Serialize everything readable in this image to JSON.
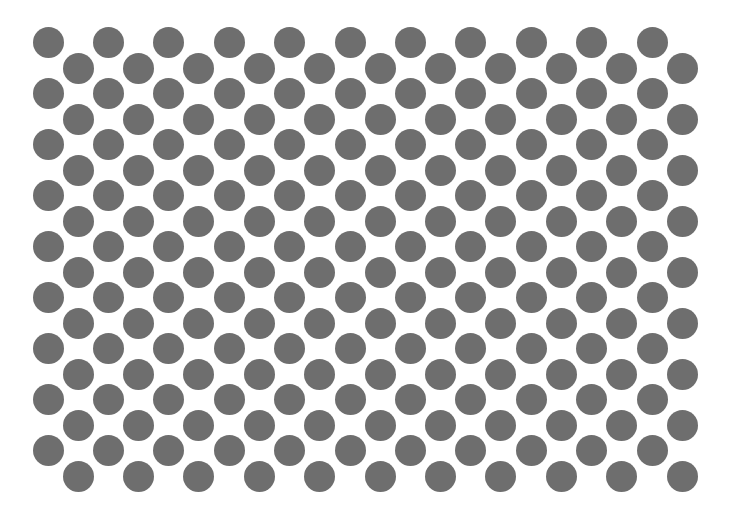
{
  "pattern": {
    "type": "staggered-dot-grid",
    "background": "#ffffff",
    "dot_color": "#6e6e6e",
    "dot_diameter": 31,
    "rows": 18,
    "cols_per_row": 11,
    "even_row_x0": 48,
    "odd_row_x0": 78,
    "x_spacing": 60.4,
    "y0": 42,
    "y_spacing": 25.5
  }
}
